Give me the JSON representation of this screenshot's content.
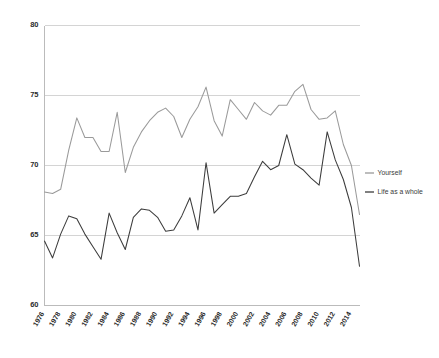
{
  "chart_data": {
    "type": "line",
    "title": "",
    "subtitle": "",
    "xlabel": "",
    "ylabel": "",
    "xlim": [
      1976,
      2015
    ],
    "ylim": [
      60,
      80
    ],
    "grid": true,
    "legend_position": "right",
    "y_ticks": [
      60,
      65,
      70,
      75,
      80
    ],
    "y_tick_labels": [
      "60",
      "65",
      "70",
      "75",
      "80"
    ],
    "x_tick_labels": [
      "1976",
      "1978",
      "1980",
      "1982",
      "1984",
      "1986",
      "1988",
      "1990",
      "1992",
      "1994",
      "1996",
      "1998",
      "2000",
      "2002",
      "2004",
      "2006",
      "2008",
      "2010",
      "2012",
      "2014"
    ],
    "x_tick_values": [
      1976,
      1978,
      1980,
      1982,
      1984,
      1986,
      1988,
      1990,
      1992,
      1994,
      1996,
      1998,
      2000,
      2002,
      2004,
      2006,
      2008,
      2010,
      2012,
      2014
    ],
    "x": [
      1976,
      1977,
      1978,
      1979,
      1980,
      1981,
      1982,
      1983,
      1984,
      1985,
      1986,
      1987,
      1988,
      1989,
      1990,
      1991,
      1992,
      1993,
      1994,
      1995,
      1996,
      1997,
      1998,
      1999,
      2000,
      2001,
      2002,
      2003,
      2004,
      2005,
      2006,
      2007,
      2008,
      2009,
      2010,
      2011,
      2012,
      2013,
      2014,
      2015
    ],
    "series": [
      {
        "name": "Yourself",
        "color": "#9a9a9a",
        "values": [
          68.1,
          68.0,
          68.3,
          71.1,
          73.4,
          72.0,
          72.0,
          71.0,
          71.0,
          73.8,
          69.5,
          71.3,
          72.4,
          73.2,
          73.8,
          74.1,
          73.5,
          72.0,
          73.3,
          74.2,
          75.6,
          73.2,
          72.1,
          74.7,
          74.0,
          73.3,
          74.5,
          73.9,
          73.6,
          74.3,
          74.3,
          75.3,
          75.8,
          74.0,
          73.3,
          73.4,
          73.9,
          71.5,
          70.0,
          66.5
        ]
      },
      {
        "name": "Life as a whole",
        "color": "#3c3c3c",
        "values": [
          64.6,
          63.4,
          65.1,
          66.4,
          66.2,
          65.1,
          64.2,
          63.3,
          66.6,
          65.2,
          64.0,
          66.3,
          66.9,
          66.8,
          66.3,
          65.3,
          65.4,
          66.4,
          67.7,
          65.4,
          70.2,
          66.6,
          67.2,
          67.8,
          67.8,
          68.0,
          69.2,
          70.3,
          69.7,
          70.0,
          72.2,
          70.1,
          69.7,
          69.1,
          68.6,
          72.4,
          70.4,
          69.0,
          67.0,
          62.8
        ]
      }
    ]
  },
  "legend": {
    "entries": [
      {
        "label": "Yourself"
      },
      {
        "label": "Life as a whole"
      }
    ]
  }
}
